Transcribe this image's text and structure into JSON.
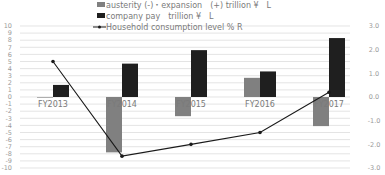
{
  "chart_data": {
    "type": "bar",
    "combo": "bar+line (dual axis)",
    "title": "",
    "categories": [
      "FY2013",
      "FY2014",
      "FY2015",
      "FY2016",
      "FY2017"
    ],
    "series": [
      {
        "name": "austerity (-)・expansion　(+)  trillion ¥　L",
        "type": "bar",
        "axis": "left",
        "color": "#808080",
        "values": [
          0,
          -7.8,
          -2.7,
          2.7,
          -4.1
        ]
      },
      {
        "name": "company pay　trillion ¥　L",
        "type": "bar",
        "axis": "left",
        "color": "#1f1f1f",
        "values": [
          1.7,
          4.7,
          6.6,
          3.6,
          8.3
        ]
      },
      {
        "name": "Household consumption level % R",
        "type": "line",
        "axis": "right",
        "color": "#1a1a1a",
        "values": [
          1.5,
          -2.5,
          -2.0,
          -1.5,
          0.2
        ]
      }
    ],
    "left_axis": {
      "ylim": [
        -10,
        10
      ],
      "ticks": [
        10,
        9,
        8,
        7,
        6,
        5,
        4,
        3,
        2,
        1,
        0,
        -1,
        -2,
        -3,
        -4,
        -5,
        -6,
        -7,
        -8,
        -9,
        -10
      ]
    },
    "right_axis": {
      "ylim": [
        -3.0,
        3.0
      ],
      "ticks": [
        "3.0",
        "2.0",
        "1.0",
        "0.0",
        "-1.0",
        "-2.0",
        "-3.0"
      ]
    },
    "xlabel": "",
    "ylabel": "",
    "grid": true,
    "legend_position": "top"
  }
}
